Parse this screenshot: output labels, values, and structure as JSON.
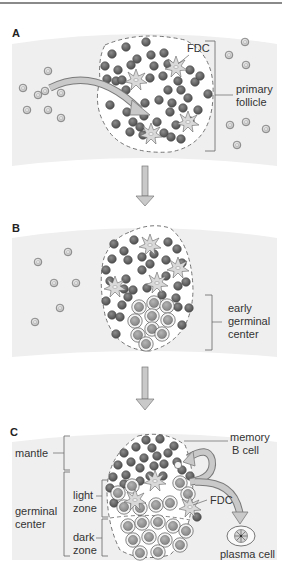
{
  "figure": {
    "panels": [
      {
        "id": "A",
        "letter": "A",
        "labels": {
          "fdc": "FDC",
          "follicle_line1": "primary",
          "follicle_line2": "follicle"
        }
      },
      {
        "id": "B",
        "letter": "B",
        "labels": {
          "gc_line1": "early",
          "gc_line2": "germinal",
          "gc_line3": "center"
        }
      },
      {
        "id": "C",
        "letter": "C",
        "labels": {
          "mantle": "mantle",
          "gc_line1": "germinal",
          "gc_line2": "center",
          "light_line1": "light",
          "light_line2": "zone",
          "dark_line1": "dark",
          "dark_line2": "zone",
          "memory_line1": "memory",
          "memory_line2": "B cell",
          "fdc": "FDC",
          "plasma": "plasma cell"
        }
      }
    ],
    "colors": {
      "tissue_band": "#efefef",
      "naive_b_cell": "#6b6b6b",
      "circulating_cell": "#d8d8d8",
      "fdc": "#d6d6d6",
      "arrow": "#bdbdbd",
      "outline": "#555555"
    }
  }
}
